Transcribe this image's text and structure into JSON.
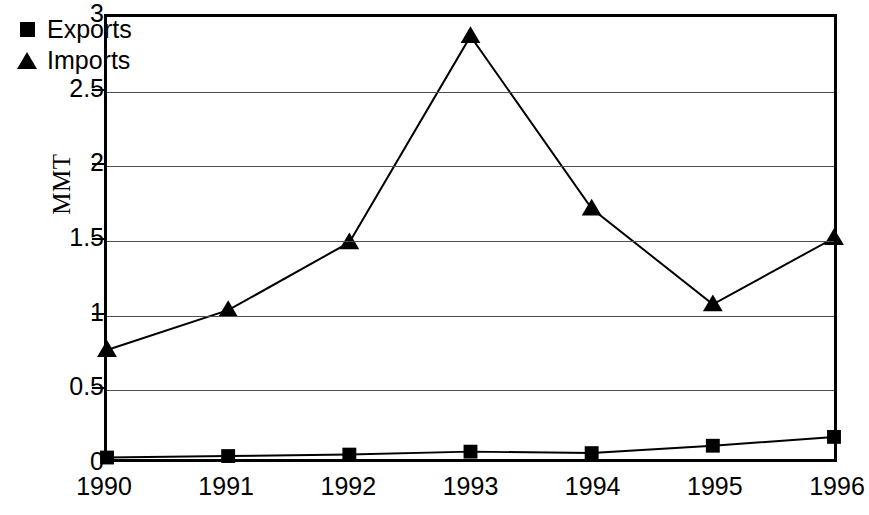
{
  "chart_data": {
    "type": "line",
    "title": "",
    "xlabel": "",
    "ylabel": "MMT",
    "categories": [
      "1990",
      "1991",
      "1992",
      "1993",
      "1994",
      "1995",
      "1996"
    ],
    "series": [
      {
        "name": "Exports",
        "marker": "square",
        "values": [
          0.01,
          0.02,
          0.03,
          0.05,
          0.04,
          0.09,
          0.15
        ]
      },
      {
        "name": "Imports",
        "marker": "triangle",
        "values": [
          0.74,
          1.01,
          1.47,
          2.87,
          1.7,
          1.05,
          1.5
        ]
      }
    ],
    "ylim": [
      0,
      3
    ],
    "yticks": [
      0,
      0.5,
      1,
      1.5,
      2,
      2.5,
      3
    ],
    "ytick_labels": [
      "0",
      "0.5",
      "1",
      "1.5",
      "2",
      "2.5",
      "3"
    ],
    "grid": "horizontal",
    "legend_position": "top-left-inside",
    "colors": {
      "series": "#000000",
      "gridline": "#4d4d4d",
      "axis": "#000000",
      "background": "#ffffff"
    }
  },
  "legend": {
    "items": [
      {
        "label": "Exports",
        "marker": "square"
      },
      {
        "label": "Imports",
        "marker": "triangle"
      }
    ]
  }
}
